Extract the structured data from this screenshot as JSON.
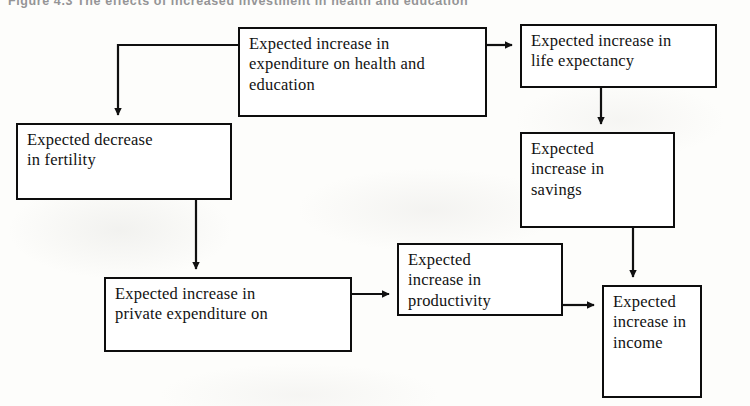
{
  "figure": {
    "caption": "Figure 4.3   The effects of increased investment in health and education",
    "caption_visible_note": "cut off at top edge"
  },
  "diagram": {
    "type": "flowchart",
    "nodes": [
      {
        "id": "health_education",
        "label": "Expected increase in\nexpenditure on health and\neducation",
        "x": 238,
        "y": 27,
        "w": 249,
        "h": 90
      },
      {
        "id": "life_expectancy",
        "label": "Expected increase in\nlife expectancy",
        "x": 520,
        "y": 24,
        "w": 197,
        "h": 64
      },
      {
        "id": "fertility",
        "label": "Expected decrease\nin fertility",
        "x": 16,
        "y": 123,
        "w": 216,
        "h": 77
      },
      {
        "id": "savings",
        "label": "Expected\nincrease in\nsavings",
        "x": 520,
        "y": 132,
        "w": 155,
        "h": 96
      },
      {
        "id": "private_expenditure",
        "label": "Expected increase in\nprivate expenditure on",
        "x": 104,
        "y": 277,
        "w": 248,
        "h": 75
      },
      {
        "id": "productivity",
        "label": "Expected\nincrease in\nproductivity",
        "x": 397,
        "y": 243,
        "w": 166,
        "h": 73
      },
      {
        "id": "income",
        "label": "Expected\nincrease in\nincome",
        "x": 602,
        "y": 285,
        "w": 100,
        "h": 113
      }
    ],
    "edges": [
      {
        "id": "e1",
        "from": "health_education",
        "to": "fertility",
        "style": "elbow-left-down"
      },
      {
        "id": "e2",
        "from": "health_education",
        "to": "life_expectancy",
        "style": "straight-right"
      },
      {
        "id": "e3",
        "from": "life_expectancy",
        "to": "savings",
        "style": "straight-down"
      },
      {
        "id": "e4",
        "from": "savings",
        "to": "income",
        "style": "elbow-down"
      },
      {
        "id": "e5",
        "from": "fertility",
        "to": "private_expenditure",
        "style": "straight-down"
      },
      {
        "id": "e6",
        "from": "private_expenditure",
        "to": "productivity",
        "style": "straight-right"
      },
      {
        "id": "e7",
        "from": "productivity",
        "to": "income",
        "style": "straight-right"
      }
    ]
  },
  "colors": {
    "page_background": "#fdfdfb",
    "box_border": "#0d0d0d",
    "box_fill": "#ffffff",
    "text": "#121212",
    "edge_stroke": "#101010",
    "caption_text": "#6d6d70"
  }
}
